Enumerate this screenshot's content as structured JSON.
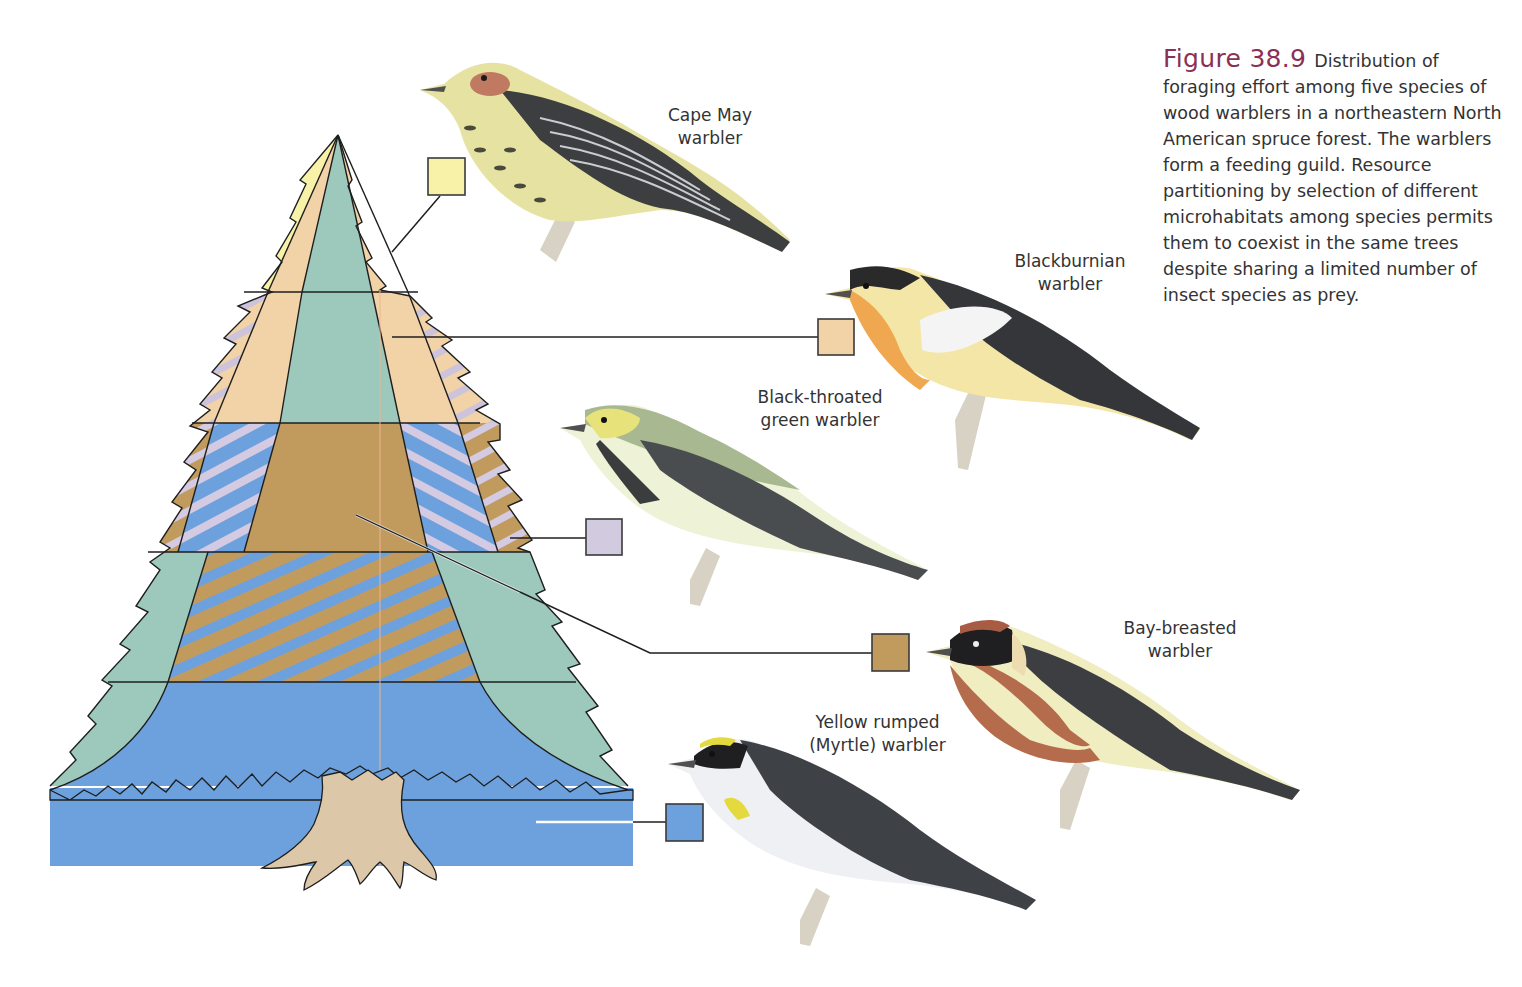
{
  "caption": {
    "figure_number": "Figure 38.9",
    "text": "Distribution of foraging effort among five species of wood warblers in a northeastern North American spruce forest. The warblers form a feeding guild. Resource partitioning by selection of different microhabitats among species permits them to coexist in the same trees despite sharing a limited number of insect species as prey.",
    "accent_color": "#8b2f55"
  },
  "species": [
    {
      "id": "cape-may",
      "label": "Cape May\nwarbler",
      "key_color": "#f7f2a8",
      "zone": "Outer tips of upper crown"
    },
    {
      "id": "blackburnian",
      "label": "Blackburnian\nwarbler",
      "key_color": "#f2d3a8",
      "zone": "Outer upper-middle crown"
    },
    {
      "id": "black-throated-green",
      "label": "Black-throated\ngreen warbler",
      "key_color": "#d2cbe0",
      "zone": "Outer middle crown (hatched with blue)"
    },
    {
      "id": "bay-breasted",
      "label": "Bay-breasted\nwarbler",
      "key_color": "#c19a5e",
      "zone": "Inner middle crown"
    },
    {
      "id": "yellow-rumped",
      "label": "Yellow rumped\n(Myrtle) warbler",
      "key_color": "#6da1de",
      "zone": "Lower tree and ground"
    }
  ],
  "tree_colors": {
    "trunk_zone": "#9cc9bc",
    "trunk": "#dcc8a8",
    "outline": "#1e1e1e",
    "center_line": "#f0b48a"
  }
}
